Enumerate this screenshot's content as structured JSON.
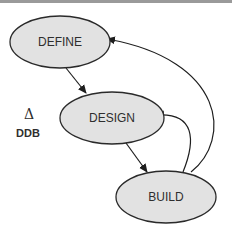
{
  "diagram": {
    "type": "state-flow",
    "nodes": [
      {
        "id": "define",
        "label": "DEFINE",
        "cx": 60,
        "cy": 42,
        "rx": 50,
        "ry": 26
      },
      {
        "id": "design",
        "label": "DESIGN",
        "cx": 112,
        "cy": 118,
        "rx": 52,
        "ry": 26
      },
      {
        "id": "build",
        "label": "BUILD",
        "cx": 166,
        "cy": 197,
        "rx": 50,
        "ry": 26
      }
    ],
    "edges": [
      {
        "from": "define",
        "to": "design"
      },
      {
        "from": "design",
        "to": "build"
      },
      {
        "from": "build",
        "to": "design"
      },
      {
        "from": "build",
        "to": "define"
      }
    ],
    "annotation": {
      "symbol": "Δ",
      "label": "DDB"
    },
    "colors": {
      "node_fill": "#e2e2e2",
      "stroke": "#2a2a2a",
      "text": "#2e2e2e",
      "top_bar": "#9a9a9a"
    }
  }
}
